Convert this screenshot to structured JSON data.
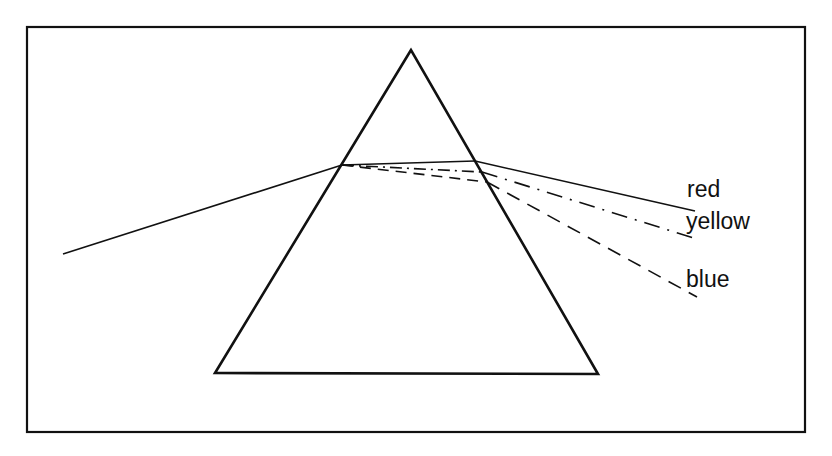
{
  "diagram": {
    "frame": {
      "x": 27,
      "y": 27,
      "width": 778,
      "height": 405
    },
    "prism": {
      "apex": [
        411,
        50
      ],
      "bottom_left": [
        215,
        373
      ],
      "bottom_right": [
        598,
        374
      ]
    },
    "incident_ray": {
      "from": [
        63,
        254
      ],
      "to": [
        342,
        165
      ]
    },
    "rays": [
      {
        "name": "red",
        "label": "red",
        "style": "solid",
        "entry": [
          342,
          165
        ],
        "exit": [
          475,
          161
        ],
        "end": [
          695,
          211
        ],
        "label_pos": [
          687,
          197
        ]
      },
      {
        "name": "yellow",
        "label": "yellow",
        "style": "dash-dot",
        "entry": [
          342,
          165
        ],
        "exit": [
          482,
          172
        ],
        "end": [
          697,
          239
        ],
        "label_pos": [
          686,
          229
        ]
      },
      {
        "name": "blue",
        "label": "blue",
        "style": "dashed",
        "entry": [
          342,
          165
        ],
        "exit": [
          487,
          182
        ],
        "end": [
          697,
          297
        ],
        "label_pos": [
          686,
          287
        ]
      }
    ],
    "colors": {
      "stroke": "#111111",
      "background": "#ffffff"
    }
  }
}
